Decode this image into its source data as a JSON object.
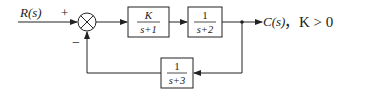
{
  "diagram": {
    "type": "block-diagram",
    "title": "",
    "input_label": "R(s)",
    "output_label": "C(s)",
    "sum_signs": {
      "input": "+",
      "feedback": "−"
    },
    "forward_blocks": [
      {
        "id": "G1",
        "numerator": "K",
        "denominator": "s+1"
      },
      {
        "id": "G2",
        "numerator": "1",
        "denominator": "s+2"
      }
    ],
    "feedback_block": {
      "id": "H",
      "numerator": "1",
      "denominator": "s+3"
    },
    "condition": "，K > 0",
    "colors": {
      "line": "#222222",
      "background": "#ffffff"
    }
  }
}
